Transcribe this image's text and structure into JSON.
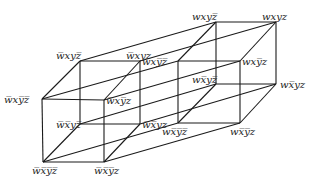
{
  "colors": {
    "edge": "#1a1a1a",
    "label": "#222222",
    "background": "#ffffff"
  },
  "vertices": [
    {
      "id": "nw_x_ny_nz",
      "label": "w̅xy̅z̅",
      "x": 42,
      "y": 99,
      "lx": 4,
      "ly": 95
    },
    {
      "id": "nw_x_ny_z",
      "label": "w̅xy̅z",
      "x": 104,
      "y": 100,
      "lx": 106,
      "ly": 96
    },
    {
      "id": "nw_nx_ny_nz",
      "label": "w̅x̅y̅z̅",
      "x": 43,
      "y": 162,
      "lx": 32,
      "ly": 166
    },
    {
      "id": "nw_nx_ny_z",
      "label": "w̅x̅y̅z",
      "x": 104,
      "y": 162,
      "lx": 94,
      "ly": 166
    },
    {
      "id": "nw_x_y_nz",
      "label": "w̅xyz̅",
      "x": 80,
      "y": 61,
      "lx": 56,
      "ly": 51
    },
    {
      "id": "nw_x_y_z",
      "label": "w̅xyz",
      "x": 140,
      "y": 61,
      "lx": 126,
      "ly": 51
    },
    {
      "id": "nw_nx_y_nz",
      "label": "w̅x̅yz̅",
      "x": 80,
      "y": 124,
      "lx": 56,
      "ly": 120
    },
    {
      "id": "nw_nx_y_z",
      "label": "w̅x̅yz",
      "x": 140,
      "y": 124,
      "lx": 142,
      "ly": 120
    },
    {
      "id": "w_x_ny_nz",
      "label": "wxy̅z̅",
      "x": 178,
      "y": 61,
      "lx": 142,
      "ly": 57
    },
    {
      "id": "w_x_ny_z",
      "label": "wxy̅z",
      "x": 240,
      "y": 61,
      "lx": 242,
      "ly": 57
    },
    {
      "id": "w_nx_ny_nz",
      "label": "wx̅y̅z̅",
      "x": 178,
      "y": 123,
      "lx": 162,
      "ly": 127
    },
    {
      "id": "w_nx_ny_z",
      "label": "wx̅y̅z",
      "x": 240,
      "y": 123,
      "lx": 230,
      "ly": 127
    },
    {
      "id": "w_x_y_nz",
      "label": "wxyz̅",
      "x": 216,
      "y": 22,
      "lx": 192,
      "ly": 12
    },
    {
      "id": "w_x_y_z",
      "label": "wxyz",
      "x": 276,
      "y": 22,
      "lx": 262,
      "ly": 12
    },
    {
      "id": "w_nx_y_nz",
      "label": "wx̅yz̅",
      "x": 216,
      "y": 84,
      "lx": 192,
      "ly": 75
    },
    {
      "id": "w_nx_y_z",
      "label": "wx̅yz",
      "x": 276,
      "y": 84,
      "lx": 280,
      "ly": 80
    }
  ]
}
